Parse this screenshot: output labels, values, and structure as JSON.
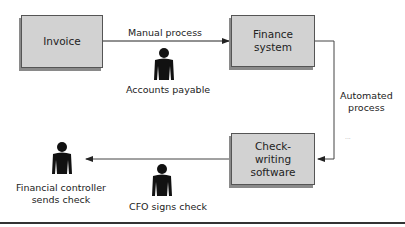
{
  "boxes": {
    "invoice": "Invoice",
    "finance": [
      "Finance",
      "system"
    ],
    "check": [
      "Check-",
      "writing",
      "software"
    ]
  },
  "edges": {
    "manual": "Manual process",
    "automated": [
      "Automated",
      "process"
    ]
  },
  "people": {
    "accounts_payable": "Accounts payable",
    "cfo": "CFO signs check",
    "controller": [
      "Financial controller",
      "sends check"
    ]
  },
  "artifact": "..."
}
